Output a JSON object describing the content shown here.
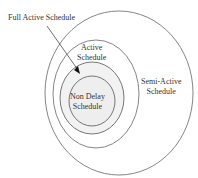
{
  "diagram": {
    "labels": {
      "full_active": "Full Active Schedule",
      "active_1": "Active",
      "active_2": "Schedule",
      "semi_1": "Semi-Active",
      "semi_2": "Schedule",
      "nondelay_1": "Non Delay",
      "nondelay_2": "Schedule"
    },
    "colors": {
      "stroke": "#555555",
      "inner_fill": "#f0f0f0"
    }
  }
}
